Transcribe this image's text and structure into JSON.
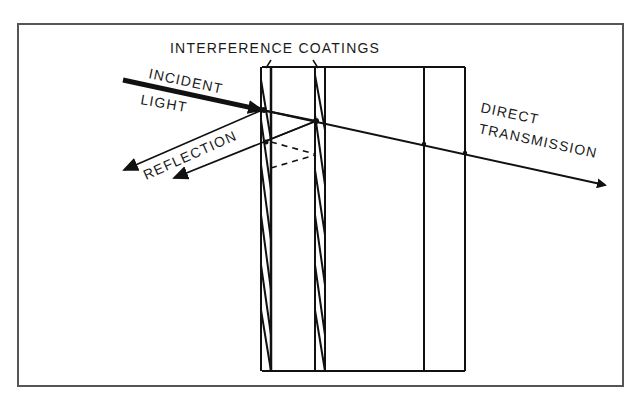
{
  "diagram": {
    "title": "INTERFERENCE COATINGS",
    "labels": {
      "incident_line1": "INCIDENT",
      "incident_line2": "LIGHT",
      "reflection": "REFLECTION",
      "direct_line1": "DIRECT",
      "direct_line2": "TRANSMISSION"
    },
    "colors": {
      "ink": "#111111",
      "frame": "#555555",
      "background": "#ffffff"
    }
  }
}
